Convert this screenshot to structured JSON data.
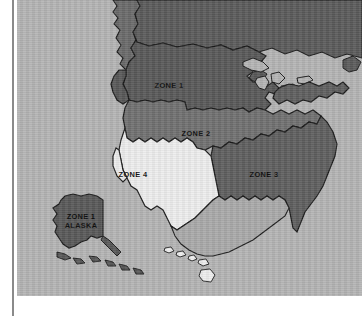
{
  "map": {
    "title": "United States Zone Map",
    "background_color": "#b4b4b4",
    "border_color": "#1a1a1a",
    "margin_color": "#ffffff",
    "rule_color": "#8a8a8a",
    "zones": [
      {
        "id": "zone-1",
        "label": "ZONE 1",
        "color": "#585858",
        "label_x": 152,
        "label_y": 88
      },
      {
        "id": "zone-2",
        "label": "ZONE 2",
        "color": "#707070",
        "label_x": 179,
        "label_y": 136
      },
      {
        "id": "zone-3",
        "label": "ZONE 3",
        "color": "#5e5e5e",
        "label_x": 231,
        "label_y": 177
      },
      {
        "id": "zone-4",
        "label": "ZONE 4",
        "color": "#ededed",
        "label_x": 116,
        "label_y": 177
      }
    ],
    "insets": [
      {
        "id": "alaska",
        "label_line_1": "ZONE 1",
        "label_line_2": "ALASKA",
        "color": "#585858",
        "label_x": 64,
        "label_y": 219
      },
      {
        "id": "hawaii",
        "label": "",
        "color": "#ededed"
      }
    ],
    "other_land": {
      "canada_color": "#5a5a5a",
      "mexico_color": "#a9a9a9",
      "lake_color": "#b4b4b4"
    }
  }
}
